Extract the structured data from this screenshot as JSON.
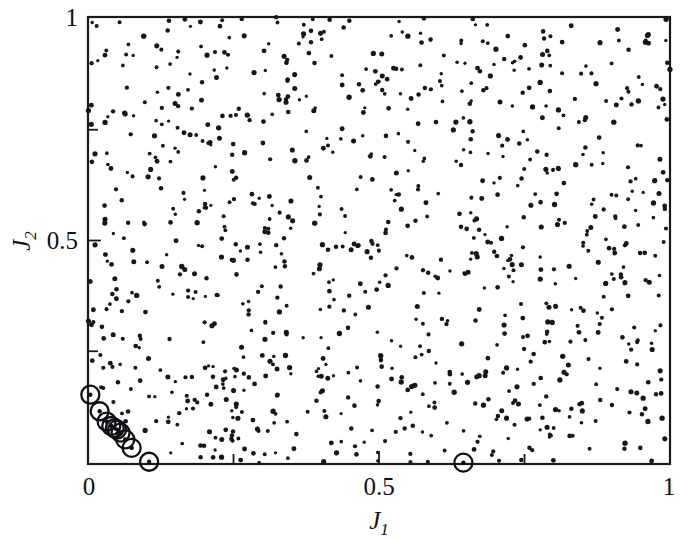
{
  "figure": {
    "kind": "scatter-plot",
    "background_color": "#ffffff",
    "ink_color": "#111111"
  },
  "chart_data": {
    "type": "scatter",
    "title": "",
    "subtitle": "",
    "xlabel": "J_1",
    "ylabel": "J_2",
    "xlabel_base": "J",
    "xlabel_sub": "1",
    "ylabel_base": "J",
    "ylabel_sub": "2",
    "xlim": [
      0,
      1
    ],
    "ylim": [
      0,
      1
    ],
    "xticks": [
      0,
      0.5,
      1
    ],
    "yticks": [
      0,
      0.5,
      1
    ],
    "xtick_labels": [
      "0",
      "0.5",
      "1"
    ],
    "ytick_labels": [
      "0",
      "0.5",
      "1"
    ],
    "minor_xticks": [
      0.25,
      0.75
    ],
    "minor_yticks": [
      0.25,
      0.75
    ],
    "grid": false,
    "legend": null,
    "annotations": [],
    "series": [
      {
        "name": "population",
        "marker": "dot",
        "marker_size": 2.1,
        "color": "#17171a",
        "count": 1000,
        "distribution": "uniform-random",
        "x": [
          0.512,
          0.027,
          0.941,
          0.337,
          0.688,
          0.155,
          0.803,
          0.472,
          0.219,
          0.905,
          0.063,
          0.598,
          0.381,
          0.744,
          0.126,
          0.857,
          0.293,
          0.641,
          0.049,
          0.977,
          0.412,
          0.186,
          0.725,
          0.534,
          0.089,
          0.963,
          0.318,
          0.672,
          0.245,
          0.831,
          0.571,
          0.104,
          0.789,
          0.358,
          0.916,
          0.203,
          0.656,
          0.447,
          0.012,
          0.883,
          0.521,
          0.274,
          0.738,
          0.165,
          0.949,
          0.395,
          0.607,
          0.082,
          0.864,
          0.331
        ],
        "y": [
          0.734,
          0.281,
          0.567,
          0.912,
          0.145,
          0.698,
          0.403,
          0.836,
          0.059,
          0.472,
          0.785,
          0.226,
          0.641,
          0.358,
          0.927,
          0.513,
          0.074,
          0.669,
          0.391,
          0.845,
          0.192,
          0.736,
          0.458,
          0.603,
          0.287,
          0.961,
          0.118,
          0.524,
          0.779,
          0.345,
          0.892,
          0.236,
          0.651,
          0.067,
          0.418,
          0.573,
          0.806,
          0.149,
          0.694,
          0.327,
          0.958,
          0.485,
          0.212,
          0.741,
          0.036,
          0.618,
          0.873,
          0.264,
          0.529,
          0.397
        ]
      },
      {
        "name": "pareto-front",
        "marker": "circle-open-with-dot",
        "marker_size": 9,
        "color": "#101014",
        "count": 11,
        "x": [
          0.004,
          0.02,
          0.032,
          0.04,
          0.046,
          0.05,
          0.056,
          0.064,
          0.075,
          0.105,
          0.645
        ],
        "y": [
          0.155,
          0.118,
          0.095,
          0.085,
          0.08,
          0.077,
          0.07,
          0.055,
          0.036,
          0.005,
          0.003
        ]
      }
    ]
  },
  "axes": {
    "x_tick_0": "0",
    "x_tick_half": "0.5",
    "x_tick_1": "1",
    "y_tick_0": "0",
    "y_tick_half": "0.5",
    "y_tick_1": "1",
    "x_axis_title_base": "J",
    "x_axis_title_sub": "1",
    "y_axis_title_base": "J",
    "y_axis_title_sub": "2"
  }
}
